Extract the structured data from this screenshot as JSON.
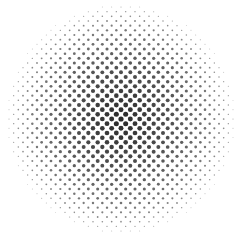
{
  "image": {
    "description": "Radial halftone dot pattern, darkest at center fading to white at edges",
    "width": 243,
    "height": 238,
    "background": "#ffffff",
    "dot_color": "#2a2a2a",
    "center": [
      121,
      119
    ],
    "radius": 118,
    "dot_spacing": 6.6,
    "grid_angle_deg": 45,
    "max_dot_radius": 2.6
  }
}
